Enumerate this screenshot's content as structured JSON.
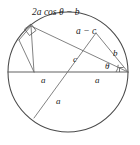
{
  "figure": {
    "background_color": "#ffffff",
    "circle_stroke_color": "#4a4a4a",
    "line_stroke_color": "#6b6b6b",
    "text_color": "#1c1c1c"
  },
  "labels": {
    "top_chord": "2a cos θ − b",
    "upper_segment": "a − c",
    "short_chord": "b",
    "center_segment": "c",
    "radius_left": "a",
    "radius_right": "a",
    "radius_lower": "a",
    "angle": "θ"
  },
  "markers": {
    "right_angle": "right-angle-square",
    "angle_arc": "theta-arc"
  },
  "geometry": {
    "circle_center_x": 68,
    "circle_center_y": 72,
    "circle_radius": 60,
    "diameter_left_x": 8,
    "diameter_right_x": 128,
    "diameter_y": 72
  }
}
